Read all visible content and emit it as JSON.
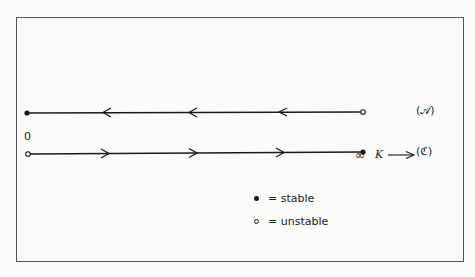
{
  "figure": {
    "origin_label": "0",
    "infinity_label": "∞",
    "parameter_label": "K",
    "parameter_arrow": "⟶",
    "branches": [
      {
        "id": "A",
        "label": "(𝒜)",
        "left_end": "stable",
        "right_end": "unstable",
        "arrow_direction": "left",
        "arrow_count": 3
      },
      {
        "id": "C",
        "label": "(ℭ)",
        "left_end": "unstable",
        "right_end": "stable",
        "arrow_direction": "right",
        "arrow_count": 3
      }
    ],
    "legend": [
      {
        "symbol": "filled-dot",
        "text": "= stable"
      },
      {
        "symbol": "open-dot",
        "text": "= unstable"
      }
    ]
  },
  "colors": {
    "ink": "#1a1a1a",
    "frame": "#555555",
    "paper": "#fbfbf9"
  }
}
